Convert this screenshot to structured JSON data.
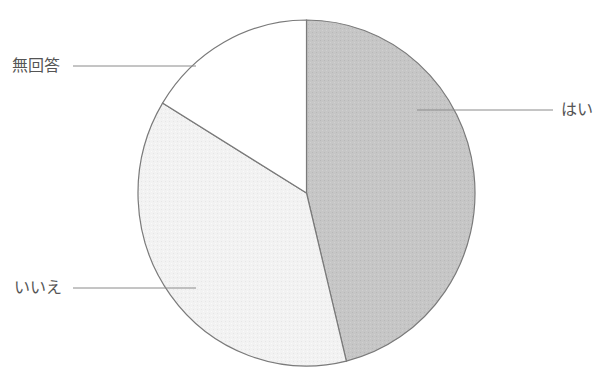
{
  "chart_data": {
    "type": "pie",
    "title": "",
    "start_angle_deg": 0,
    "direction": "clockwise",
    "slices": [
      {
        "label": "はい",
        "value": 46.2,
        "color": "#c4c4c4"
      },
      {
        "label": "いいえ",
        "value": 37.5,
        "color": "#f1f1f1"
      },
      {
        "label": "無回答",
        "value": 16.3,
        "color": "#ffffff"
      }
    ],
    "legend": "none",
    "annotations": "leader-line labels"
  },
  "labels": {
    "yes": "はい",
    "no": "いいえ",
    "no_answer": "無回答"
  },
  "colors": {
    "outline": "#7a7a7a",
    "leader_line": "#8a8a8a",
    "text": "#555555"
  }
}
